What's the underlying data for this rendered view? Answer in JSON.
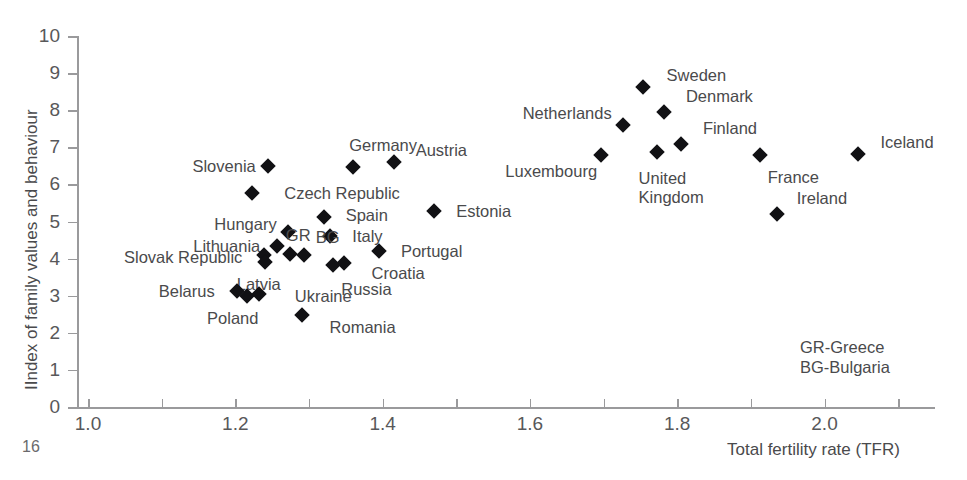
{
  "page": {
    "number": "16"
  },
  "chart_data": {
    "type": "scatter",
    "title": "",
    "xlabel": "Total fertility rate (TFR)",
    "ylabel": "IIndex of family values and behaviour",
    "xlim": [
      1.0,
      2.15
    ],
    "ylim": [
      0,
      10
    ],
    "grid": false,
    "legend_position": "bottom-right",
    "xticks": [
      "1.0",
      "1.2",
      "1.4",
      "1.6",
      "1.8",
      "2.0"
    ],
    "xtick_values": [
      1.0,
      1.2,
      1.4,
      1.6,
      1.8,
      2.0
    ],
    "yticks": [
      "0",
      "1",
      "2",
      "3",
      "4",
      "5",
      "6",
      "7",
      "8",
      "9",
      "10"
    ],
    "ytick_values": [
      0,
      1,
      2,
      3,
      4,
      5,
      6,
      7,
      8,
      9,
      10
    ],
    "minor_xtick_values": [
      1.1,
      1.3,
      1.5,
      1.7,
      1.9,
      2.1
    ],
    "abbreviations": [
      "GR-Greece",
      "BG-Bulgaria"
    ],
    "points": [
      {
        "name": "Slovenia",
        "label": "Slovenia",
        "x": 1.245,
        "y": 6.5,
        "label_dx": -76,
        "label_dy": 0
      },
      {
        "name": "Germany",
        "label": "Germany",
        "x": 1.36,
        "y": 6.47,
        "label_dx": -4,
        "label_dy": -22
      },
      {
        "name": "Austria",
        "label": "Austria",
        "x": 1.415,
        "y": 6.6,
        "label_dx": 22,
        "label_dy": -12
      },
      {
        "name": "Czech Republic",
        "label": "Czech Republic",
        "x": 1.223,
        "y": 5.77,
        "label_dx": 32,
        "label_dy": 0
      },
      {
        "name": "Spain",
        "label": "Spain",
        "x": 1.32,
        "y": 5.12,
        "label_dx": 22,
        "label_dy": -2
      },
      {
        "name": "Estonia",
        "label": "Estonia",
        "x": 1.47,
        "y": 5.28,
        "label_dx": 22,
        "label_dy": 0
      },
      {
        "name": "Hungary",
        "label": "Hungary",
        "x": 1.272,
        "y": 4.73,
        "label_dx": -74,
        "label_dy": -8
      },
      {
        "name": "Lithuania",
        "label": "Lithuania",
        "x": 1.257,
        "y": 4.33,
        "label_dx": -84,
        "label_dy": 0
      },
      {
        "name": "Italy",
        "label": "Italy",
        "x": 1.329,
        "y": 4.61,
        "label_dx": 22,
        "label_dy": 0
      },
      {
        "name": "Slovak Republic",
        "label": "Slovak Republic",
        "x": 1.239,
        "y": 4.1,
        "label_dx": -140,
        "label_dy": 2
      },
      {
        "name": "GR",
        "label": "GR",
        "x": 1.274,
        "y": 4.12,
        "label_dx": -4,
        "label_dy": -19
      },
      {
        "name": "BG",
        "label": "BG",
        "x": 1.293,
        "y": 4.1,
        "label_dx": 12,
        "label_dy": -18
      },
      {
        "name": "Portugal",
        "label": "Portugal",
        "x": 1.395,
        "y": 4.2,
        "label_dx": 22,
        "label_dy": 0
      },
      {
        "name": "Croatia",
        "label": "Croatia",
        "x": 1.347,
        "y": 3.88,
        "label_dx": 28,
        "label_dy": 10
      },
      {
        "name": "Latvia",
        "label": "Latvia",
        "x": 1.24,
        "y": 3.9,
        "label_dx": -28,
        "label_dy": 22
      },
      {
        "name": "Russia",
        "label": "Russia",
        "x": 1.333,
        "y": 3.83,
        "label_dx": 8,
        "label_dy": 24
      },
      {
        "name": "Belarus",
        "label": "Belarus",
        "x": 1.202,
        "y": 3.14,
        "label_dx": -78,
        "label_dy": 0
      },
      {
        "name": "Poland",
        "label": "Poland",
        "x": 1.216,
        "y": 3.0,
        "label_dx": -40,
        "label_dy": 22
      },
      {
        "name": "Ukraine",
        "label": "Ukraine",
        "x": 1.232,
        "y": 3.05,
        "label_dx": 36,
        "label_dy": 2
      },
      {
        "name": "Romania",
        "label": "Romania",
        "x": 1.29,
        "y": 2.48,
        "label_dx": 28,
        "label_dy": 12
      },
      {
        "name": "Sweden",
        "label": "Sweden",
        "x": 1.753,
        "y": 8.62,
        "label_dx": 24,
        "label_dy": -12
      },
      {
        "name": "Denmark",
        "label": "Denmark",
        "x": 1.782,
        "y": 7.94,
        "label_dx": 22,
        "label_dy": -16
      },
      {
        "name": "Netherlands",
        "label": "Netherlands",
        "x": 1.726,
        "y": 7.6,
        "label_dx": -100,
        "label_dy": -12
      },
      {
        "name": "Finland",
        "label": "Finland",
        "x": 1.805,
        "y": 7.08,
        "label_dx": 22,
        "label_dy": -16
      },
      {
        "name": "Luxembourg",
        "label": "Luxembourg",
        "x": 1.697,
        "y": 6.8,
        "label_dx": -96,
        "label_dy": 16
      },
      {
        "name": "United Kingdom",
        "label": "United\nKingdom",
        "x": 1.772,
        "y": 6.88,
        "label_dx": -18,
        "label_dy": 26
      },
      {
        "name": "France",
        "label": "France",
        "x": 1.912,
        "y": 6.8,
        "label_dx": 8,
        "label_dy": 22
      },
      {
        "name": "Iceland",
        "label": "Iceland",
        "x": 2.046,
        "y": 6.82,
        "label_dx": 22,
        "label_dy": -12
      },
      {
        "name": "Ireland",
        "label": "Ireland",
        "x": 1.935,
        "y": 5.2,
        "label_dx": 20,
        "label_dy": -16
      }
    ]
  }
}
